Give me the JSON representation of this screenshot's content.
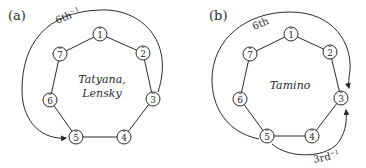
{
  "panels": [
    {
      "label": "(a)",
      "center_text": [
        "Tatyana,",
        "Lensky"
      ],
      "nodes": [
        "1",
        "2",
        "3",
        "4",
        "5",
        "6",
        "7"
      ],
      "arc_label": "6th",
      "arc_label_sup": "−1",
      "arc_description": "arrow from node 3 counter-clockwise over top to node 5"
    },
    {
      "label": "(b)",
      "center_text": [
        "Tamino"
      ],
      "nodes": [
        "1",
        "2",
        "3",
        "4",
        "5",
        "6",
        "7"
      ],
      "arc_label": "6th",
      "arc_label_sup": "",
      "arc_description": "arrow from node 5 clockwise over top to node 3",
      "arc2_label": "3rd",
      "arc2_label_sup": "−1",
      "arc2_description": "arrow from node 5 counter-clockwise below to node 3"
    }
  ],
  "colors": {
    "ink": "#2a2a2a",
    "background": "#ffffff"
  }
}
